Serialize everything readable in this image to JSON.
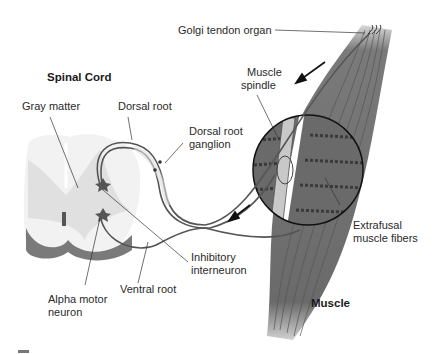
{
  "diagram": {
    "title_spinal": "Spinal Cord",
    "title_muscle": "Muscle",
    "labels": {
      "golgi": "Golgi tendon organ",
      "spindle_1": "Muscle",
      "spindle_2": "spindle",
      "gray_matter": "Gray matter",
      "dorsal_root": "Dorsal root",
      "drg_1": "Dorsal root",
      "drg_2": "ganglion",
      "inhib_1": "Inhibitory",
      "inhib_2": "interneuron",
      "ventral_root": "Ventral root",
      "alpha_1": "Alpha motor",
      "alpha_2": "neuron",
      "extra_1": "Extrafusal",
      "extra_2": "muscle fibers"
    },
    "colors": {
      "muscle": "#6e6e6e",
      "gray_matter": "#e2e2e2",
      "white_matter": "#f2f2f2",
      "ventral_shade": "#7a7a7a",
      "nerve": "#555555"
    }
  }
}
